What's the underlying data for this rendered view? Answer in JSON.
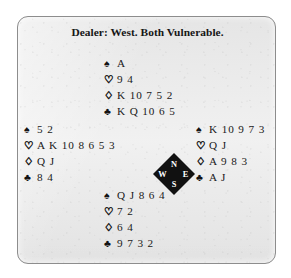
{
  "diagram": {
    "title": "Dealer: West. Both Vulnerable.",
    "suit_symbols": {
      "spade": "♠",
      "heart": "♡",
      "diamond": "♢",
      "club": "♣"
    },
    "compass": {
      "north": "N",
      "west": "W",
      "east": "E",
      "south": "S",
      "fill_color": "#111111",
      "label_color": "#ffffff"
    },
    "hands": {
      "north": {
        "spades": "A",
        "hearts": "9 4",
        "diamonds": "K 10 7 5 2",
        "clubs": "K Q 10 6 5"
      },
      "west": {
        "spades": "5 2",
        "hearts": "A K 10 8 6 5 3",
        "diamonds": "Q J",
        "clubs": "8 4"
      },
      "east": {
        "spades": "K 10 9 7 3",
        "hearts": "Q J",
        "diamonds": "A 9 8 3",
        "clubs": "A J"
      },
      "south": {
        "spades": "Q J 8 6 4",
        "hearts": "7 2",
        "diamonds": "6 4",
        "clubs": "9 7 3 2"
      }
    }
  }
}
